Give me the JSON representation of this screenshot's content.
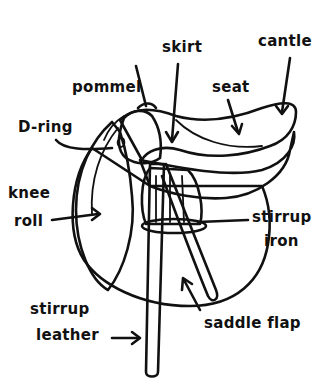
{
  "diagram": {
    "subject": "saddle",
    "colors": {
      "ink": "#111111",
      "leather_dark": "#8e8e8e",
      "leather_mid": "#a3a3a3",
      "leather_light": "#bdbdbd",
      "highlight": "#d6d6d6",
      "background": "#ffffff"
    },
    "labels": [
      {
        "id": "cantle",
        "text": "cantle"
      },
      {
        "id": "skirt",
        "text": "skirt"
      },
      {
        "id": "pommel",
        "text": "pommel"
      },
      {
        "id": "seat",
        "text": "seat"
      },
      {
        "id": "d-ring",
        "text": "D-ring"
      },
      {
        "id": "knee-roll-1",
        "text": "knee"
      },
      {
        "id": "knee-roll-2",
        "text": "roll"
      },
      {
        "id": "stirrup-iron-1",
        "text": "stirrup"
      },
      {
        "id": "stirrup-iron-2",
        "text": "iron"
      },
      {
        "id": "stirrup-leather-1",
        "text": "stirrup"
      },
      {
        "id": "stirrup-leather-2",
        "text": "leather"
      },
      {
        "id": "saddle-flap",
        "text": "saddle flap"
      }
    ]
  }
}
